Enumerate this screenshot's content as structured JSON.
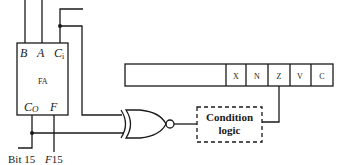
{
  "full_adder": {
    "title": "FA",
    "inputs": {
      "b": "B",
      "a": "A",
      "ci": "C",
      "ci_sub": "i"
    },
    "outputs": {
      "co": "C",
      "co_sub": "O",
      "f": "F"
    }
  },
  "labels": {
    "bit15": "Bit 15",
    "f15_prefix": "F",
    "f15_suffix": "15"
  },
  "status_register": {
    "flags": [
      "X",
      "N",
      "Z",
      "V",
      "C"
    ]
  },
  "condition_logic": {
    "line1": "Condition",
    "line2": "logic"
  },
  "gate": {
    "type": "XNOR"
  },
  "colors": {
    "line": "#1a1a1a",
    "background": "#ffffff"
  }
}
